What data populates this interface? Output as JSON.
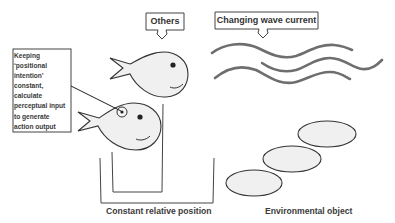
{
  "diagram": {
    "labels": {
      "others": "Others",
      "wave_current": "Changing wave current",
      "constant_relative_position": "Constant relative position",
      "environmental_object": "Environmental object"
    },
    "callout": {
      "lines": [
        "Keeping",
        "‘positional",
        "intention’",
        "constant,",
        "calculate",
        "perceptual input",
        "to generate",
        "action output"
      ]
    },
    "elements": {
      "fish": [
        "other-fish",
        "self-fish"
      ],
      "waves": 3,
      "environmental_objects": 3
    },
    "colors": {
      "stroke": "#333333",
      "fill": "#f0f0f0",
      "wave": "#6e6e6e",
      "text": "#3a3a3a"
    }
  }
}
